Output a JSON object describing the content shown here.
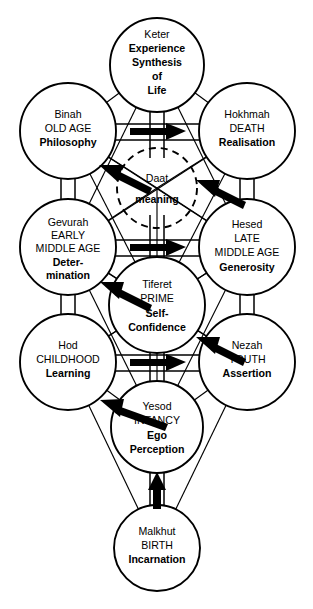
{
  "diagram": {
    "subtitle": "Kabbalistic Sephiroth with life-stage correspondences",
    "background_color": "#ffffff",
    "line_color": "#000000",
    "circle_fill": "#ffffff"
  },
  "sephiroth": [
    {
      "id": "keter",
      "name": "Keter",
      "stage": "",
      "quality_lines": [
        "Experience",
        "Synthesis",
        "of",
        "Life"
      ],
      "cx": 157,
      "cy": 65,
      "r": 47,
      "style": "solid"
    },
    {
      "id": "binah",
      "name": "Binah",
      "stage": "OLD AGE",
      "quality_lines": [
        "Philosophy"
      ],
      "cx": 68,
      "cy": 131,
      "r": 48,
      "style": "solid"
    },
    {
      "id": "hokhmah",
      "name": "Hokhmah",
      "stage": "DEATH",
      "quality_lines": [
        "Realisation"
      ],
      "cx": 247,
      "cy": 131,
      "r": 48,
      "style": "solid"
    },
    {
      "id": "daat",
      "name": "Daat",
      "stage": "",
      "quality_lines": [
        "meaning"
      ],
      "cx": 157,
      "cy": 188,
      "r": 40,
      "style": "dashed"
    },
    {
      "id": "gevurah",
      "name": "Gevurah",
      "stage": "EARLY MIDDLE AGE",
      "quality_lines": [
        "Deter-",
        "mination"
      ],
      "cx": 68,
      "cy": 247,
      "r": 48,
      "style": "solid"
    },
    {
      "id": "hesed",
      "name": "Hesed",
      "stage": "LATE MIDDLE AGE",
      "quality_lines": [
        "Generosity"
      ],
      "cx": 247,
      "cy": 247,
      "r": 48,
      "style": "solid"
    },
    {
      "id": "tiferet",
      "name": "Tiferet",
      "stage": "PRIME",
      "quality_lines": [
        "Self-",
        "Confidence"
      ],
      "cx": 157,
      "cy": 305,
      "r": 48,
      "style": "solid"
    },
    {
      "id": "hod",
      "name": "Hod",
      "stage": "CHILDHOOD",
      "quality_lines": [
        "Learning"
      ],
      "cx": 68,
      "cy": 362,
      "r": 48,
      "style": "solid"
    },
    {
      "id": "nezah",
      "name": "Nezah",
      "stage": "YOUTH",
      "quality_lines": [
        "Assertion"
      ],
      "cx": 247,
      "cy": 362,
      "r": 48,
      "style": "solid"
    },
    {
      "id": "yesod",
      "name": "Yesod",
      "stage": "INFANCY",
      "quality_lines": [
        "Ego",
        "Perception"
      ],
      "cx": 157,
      "cy": 427,
      "r": 46,
      "style": "solid"
    },
    {
      "id": "malkhut",
      "name": "Malkhut",
      "stage": "BIRTH",
      "quality_lines": [
        "Incarnation"
      ],
      "cx": 157,
      "cy": 548,
      "r": 43,
      "style": "solid"
    }
  ],
  "flow_arrows": [
    {
      "id": "malkhut-to-yesod",
      "direction": "up",
      "label": "Birth to Infancy"
    },
    {
      "id": "yesod-to-hod",
      "direction": "up-left",
      "label": "Infancy to Childhood"
    },
    {
      "id": "hod-to-nezah",
      "direction": "right",
      "label": "Childhood to Youth"
    },
    {
      "id": "nezah-to-tiferet",
      "direction": "up-left",
      "label": "Youth to Prime"
    },
    {
      "id": "tiferet-to-gevurah",
      "direction": "up-left",
      "label": "Prime to Early Middle Age"
    },
    {
      "id": "gevurah-to-hesed",
      "direction": "right",
      "label": "Early Middle Age to Late Middle Age"
    },
    {
      "id": "hesed-to-daat",
      "direction": "up-left",
      "label": "Late Middle Age to Meaning"
    },
    {
      "id": "daat-to-binah",
      "direction": "up-left",
      "label": "Meaning to Old Age"
    },
    {
      "id": "binah-to-hokhmah",
      "direction": "right",
      "label": "Old Age to Death"
    }
  ]
}
